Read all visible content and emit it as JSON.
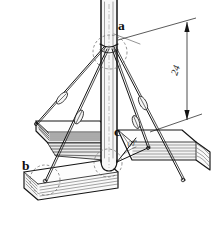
{
  "figure": {
    "background_color": "#ffffff",
    "ink_color": "#141414",
    "labels": [
      {
        "id": "a",
        "text": "a",
        "x": 118,
        "y": 30,
        "target": "top-guy-attachment"
      },
      {
        "id": "b",
        "text": "b",
        "x": 22,
        "y": 170,
        "target": "lower-anchor-point"
      },
      {
        "id": "c",
        "text": "c",
        "x": 114,
        "y": 136,
        "target": "pole-base-joint"
      }
    ],
    "dimensions": [
      {
        "id": "height-24",
        "value": "24",
        "x": 178,
        "y": 75,
        "from_y": 22,
        "to_y": 120,
        "rail_x": 187,
        "orientation": "vertical",
        "arrows": "both"
      }
    ],
    "angles": [
      {
        "id": "guy-angle",
        "text": "60°",
        "x": 130,
        "y": 148,
        "vertex_x": 117,
        "vertex_y": 161
      }
    ],
    "callout_circles": [
      {
        "id": "circle-a",
        "cx": 110,
        "cy": 52,
        "r": 17
      },
      {
        "id": "circle-b",
        "cx": 45,
        "cy": 180,
        "r": 15
      },
      {
        "id": "circle-c",
        "cx": 108,
        "cy": 163,
        "r": 14
      }
    ],
    "components": [
      {
        "name": "vertical-pole",
        "kind": "round-timber-post"
      },
      {
        "name": "guy-wire-left-upper",
        "kind": "tension-cable"
      },
      {
        "name": "guy-wire-left-lower",
        "kind": "tension-cable"
      },
      {
        "name": "guy-wire-right-upper",
        "kind": "tension-cable"
      },
      {
        "name": "guy-wire-right-lower",
        "kind": "tension-cable"
      },
      {
        "name": "turnbuckle",
        "kind": "cable-tensioner",
        "count": 4
      },
      {
        "name": "timber-sill-left",
        "kind": "lumber-beam"
      },
      {
        "name": "timber-sill-right",
        "kind": "lumber-beam"
      },
      {
        "name": "timber-sill-front",
        "kind": "lumber-beam"
      }
    ]
  }
}
